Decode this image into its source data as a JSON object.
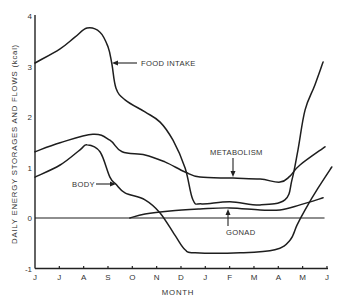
{
  "figure": {
    "ylabel": "DAILY ENERGY STORAGES AND FLOWS (kcal)",
    "xlabel": "MONTH",
    "annotations": {
      "food_intake": "FOOD INTAKE",
      "metabolism": "METABOLISM",
      "body": "BODY",
      "gonad": "GONAD"
    },
    "colors": {
      "line": "#1e1e1e",
      "text": "#333333",
      "background": "#ffffff"
    }
  },
  "chart_data": {
    "type": "line",
    "title": "",
    "xlabel": "MONTH",
    "ylabel": "DAILY ENERGY STORAGES AND FLOWS (kcal)",
    "categories": [
      "J",
      "J",
      "A",
      "S",
      "O",
      "N",
      "D",
      "J",
      "F",
      "M",
      "A",
      "M",
      "J"
    ],
    "yticks": [
      4,
      3,
      2,
      1,
      0,
      -1
    ],
    "ylim": [
      -1,
      4
    ],
    "xlim": [
      0,
      12
    ],
    "grid": false,
    "legend": "none - series identified by inline labels with arrows",
    "x_units": "month index (0 = June ... 12 = June)",
    "series": [
      {
        "name": "FOOD INTAKE",
        "points": [
          [
            0,
            3.07
          ],
          [
            1.03,
            3.35
          ],
          [
            1.64,
            3.58
          ],
          [
            2.14,
            3.76
          ],
          [
            2.67,
            3.68
          ],
          [
            3.0,
            3.39
          ],
          [
            3.16,
            3.05
          ],
          [
            3.33,
            2.57
          ],
          [
            3.7,
            2.34
          ],
          [
            4.52,
            2.1
          ],
          [
            5.14,
            1.9
          ],
          [
            5.67,
            1.54
          ],
          [
            6.17,
            0.99
          ],
          [
            6.49,
            0.36
          ],
          [
            6.86,
            0.28
          ],
          [
            8.01,
            0.32
          ],
          [
            9.25,
            0.26
          ],
          [
            10.27,
            0.36
          ],
          [
            10.56,
            0.75
          ],
          [
            10.81,
            1.35
          ],
          [
            11.1,
            2.14
          ],
          [
            11.5,
            2.63
          ],
          [
            11.84,
            3.09
          ]
        ]
      },
      {
        "name": "METABOLISM",
        "points": [
          [
            0,
            1.31
          ],
          [
            1.03,
            1.49
          ],
          [
            2.38,
            1.66
          ],
          [
            3.08,
            1.54
          ],
          [
            3.58,
            1.31
          ],
          [
            4.52,
            1.25
          ],
          [
            5.34,
            1.11
          ],
          [
            6.17,
            0.91
          ],
          [
            6.78,
            0.81
          ],
          [
            8.14,
            0.79
          ],
          [
            9.25,
            0.77
          ],
          [
            10.07,
            0.71
          ],
          [
            10.48,
            0.83
          ],
          [
            10.89,
            1.05
          ],
          [
            11.92,
            1.41
          ]
        ]
      },
      {
        "name": "BODY",
        "points": [
          [
            0,
            0.81
          ],
          [
            1.03,
            1.05
          ],
          [
            1.85,
            1.35
          ],
          [
            2.14,
            1.45
          ],
          [
            2.67,
            1.31
          ],
          [
            3.08,
            0.81
          ],
          [
            3.33,
            0.67
          ],
          [
            3.7,
            0.5
          ],
          [
            4.52,
            0.36
          ],
          [
            5.14,
            0.1
          ],
          [
            5.75,
            -0.34
          ],
          [
            6.17,
            -0.63
          ],
          [
            6.58,
            -0.69
          ],
          [
            8.43,
            -0.69
          ],
          [
            9.86,
            -0.63
          ],
          [
            10.48,
            -0.44
          ],
          [
            10.77,
            -0.14
          ],
          [
            11.1,
            0.16
          ],
          [
            11.63,
            0.59
          ],
          [
            12.2,
            1.01
          ]
        ]
      },
      {
        "name": "GONAD",
        "points": [
          [
            3.9,
            0.0
          ],
          [
            4.52,
            0.08
          ],
          [
            5.55,
            0.14
          ],
          [
            6.78,
            0.18
          ],
          [
            8.01,
            0.2
          ],
          [
            9.25,
            0.16
          ],
          [
            10.07,
            0.16
          ],
          [
            10.89,
            0.26
          ],
          [
            11.84,
            0.4
          ]
        ]
      }
    ],
    "reference_lines": [
      {
        "name": "zero",
        "y": 0,
        "x_from": 0,
        "x_to": 11.9
      }
    ]
  }
}
